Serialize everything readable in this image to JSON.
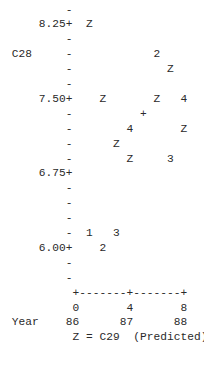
{
  "chart_data": {
    "type": "scatter",
    "title": "",
    "ylabel": "C28",
    "xlabel": "Year",
    "legend": "Z = C29 (Predicted)",
    "y_tick_labels": [
      "8.25",
      "7.50",
      "6.75",
      "6.00"
    ],
    "x_tick_labels_index": [
      "0",
      "4",
      "8"
    ],
    "x_tick_labels_year": [
      "86",
      "87",
      "88"
    ],
    "ylim": [
      5.8,
      8.4
    ],
    "xlim": [
      0,
      8
    ],
    "grid": false,
    "symbol_notes": "Digits mark observed C28 values at quarter index; Z marks predicted C29; + marks overlapping points",
    "points": [
      {
        "x": 1,
        "y": 8.25,
        "symbol": "Z",
        "series": "C29 (Predicted)"
      },
      {
        "x": 6,
        "y": 8.0,
        "symbol": "2",
        "series": "C28"
      },
      {
        "x": 6.5,
        "y": 7.9,
        "symbol": "Z",
        "series": "C29 (Predicted)"
      },
      {
        "x": 2,
        "y": 7.5,
        "symbol": "Z",
        "series": "C29 (Predicted)"
      },
      {
        "x": 6,
        "y": 7.5,
        "symbol": "Z",
        "series": "C29 (Predicted)"
      },
      {
        "x": 7,
        "y": 7.5,
        "symbol": "4",
        "series": "C28"
      },
      {
        "x": 5,
        "y": 7.4,
        "symbol": "+",
        "series": "overlap"
      },
      {
        "x": 4,
        "y": 7.3,
        "symbol": "4",
        "series": "C28"
      },
      {
        "x": 7,
        "y": 7.3,
        "symbol": "Z",
        "series": "C29 (Predicted)"
      },
      {
        "x": 3,
        "y": 7.1,
        "symbol": "Z",
        "series": "C29 (Predicted)"
      },
      {
        "x": 4,
        "y": 6.9,
        "symbol": "Z",
        "series": "C29 (Predicted)"
      },
      {
        "x": 6.5,
        "y": 6.9,
        "symbol": "3",
        "series": "C28"
      },
      {
        "x": 1,
        "y": 6.1,
        "symbol": "1",
        "series": "C28"
      },
      {
        "x": 3,
        "y": 6.1,
        "symbol": "3",
        "series": "C28"
      },
      {
        "x": 2,
        "y": 6.0,
        "symbol": "2",
        "series": "C28"
      }
    ]
  },
  "lines": [
    {
      "row": 0,
      "segments": [
        {
          "col": 9,
          "text": "-"
        }
      ]
    },
    {
      "row": 1,
      "segments": [
        {
          "col": 5,
          "text": "8.25+"
        },
        {
          "col": 12,
          "text": "Z"
        }
      ]
    },
    {
      "row": 2,
      "segments": [
        {
          "col": 9,
          "text": "-"
        }
      ]
    },
    {
      "row": 3,
      "segments": [
        {
          "col": 1,
          "text": "C28"
        },
        {
          "col": 9,
          "text": "-"
        },
        {
          "col": 22,
          "text": "2"
        }
      ]
    },
    {
      "row": 4,
      "segments": [
        {
          "col": 9,
          "text": "-"
        },
        {
          "col": 24,
          "text": "Z"
        }
      ]
    },
    {
      "row": 5,
      "segments": [
        {
          "col": 9,
          "text": "-"
        }
      ]
    },
    {
      "row": 6,
      "segments": [
        {
          "col": 5,
          "text": "7.50+"
        },
        {
          "col": 14,
          "text": "Z"
        },
        {
          "col": 22,
          "text": "Z"
        },
        {
          "col": 26,
          "text": "4"
        }
      ]
    },
    {
      "row": 7,
      "segments": [
        {
          "col": 9,
          "text": "-"
        },
        {
          "col": 20,
          "text": "+"
        }
      ]
    },
    {
      "row": 8,
      "segments": [
        {
          "col": 9,
          "text": "-"
        },
        {
          "col": 18,
          "text": "4"
        },
        {
          "col": 26,
          "text": "Z"
        }
      ]
    },
    {
      "row": 9,
      "segments": [
        {
          "col": 9,
          "text": "-"
        },
        {
          "col": 16,
          "text": "Z"
        }
      ]
    },
    {
      "row": 10,
      "segments": [
        {
          "col": 9,
          "text": "-"
        },
        {
          "col": 18,
          "text": "Z"
        },
        {
          "col": 24,
          "text": "3"
        }
      ]
    },
    {
      "row": 11,
      "segments": [
        {
          "col": 5,
          "text": "6.75+"
        }
      ]
    },
    {
      "row": 12,
      "segments": [
        {
          "col": 9,
          "text": "-"
        }
      ]
    },
    {
      "row": 13,
      "segments": [
        {
          "col": 9,
          "text": "-"
        }
      ]
    },
    {
      "row": 14,
      "segments": [
        {
          "col": 9,
          "text": "-"
        }
      ]
    },
    {
      "row": 15,
      "segments": [
        {
          "col": 9,
          "text": "-"
        },
        {
          "col": 12,
          "text": "1"
        },
        {
          "col": 16,
          "text": "3"
        }
      ]
    },
    {
      "row": 16,
      "segments": [
        {
          "col": 5,
          "text": "6.00+"
        },
        {
          "col": 14,
          "text": "2"
        }
      ]
    },
    {
      "row": 17,
      "segments": [
        {
          "col": 9,
          "text": "-"
        }
      ]
    },
    {
      "row": 18,
      "segments": [
        {
          "col": 9,
          "text": "-"
        }
      ]
    },
    {
      "row": 19,
      "segments": [
        {
          "col": 10,
          "text": "+-------+-------+"
        }
      ]
    },
    {
      "row": 20,
      "segments": [
        {
          "col": 10,
          "text": "0"
        },
        {
          "col": 18,
          "text": "4"
        },
        {
          "col": 26,
          "text": "8"
        }
      ]
    },
    {
      "row": 21,
      "segments": [
        {
          "col": 1,
          "text": "Year"
        },
        {
          "col": 9,
          "text": "86"
        },
        {
          "col": 17,
          "text": "87"
        },
        {
          "col": 25,
          "text": "88"
        }
      ]
    },
    {
      "row": 22,
      "segments": [
        {
          "col": 10,
          "text": "Z = C29  (Predicted)"
        }
      ]
    }
  ]
}
